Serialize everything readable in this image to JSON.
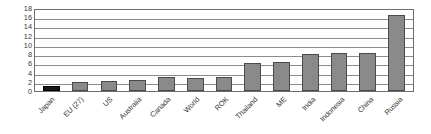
{
  "chart_data": {
    "type": "bar",
    "title": "",
    "xlabel": "",
    "ylabel": "Energy Consumption/GDP",
    "ylim": [
      0,
      18
    ],
    "ytick_step": 2,
    "yticks": [
      18,
      16,
      14,
      12,
      10,
      8,
      6,
      4,
      2,
      0
    ],
    "grid": true,
    "legend": "none",
    "categories": [
      "Japan",
      "EU (27)",
      "US",
      "Australia",
      "Canada",
      "World",
      "ROK",
      "Thailand",
      "ME",
      "India",
      "Indonesia",
      "China",
      "Russia"
    ],
    "values": [
      1.0,
      2.0,
      2.1,
      2.4,
      3.0,
      2.9,
      3.1,
      6.0,
      6.3,
      8.0,
      8.2,
      8.2,
      16.5
    ],
    "highlight_index": 0,
    "colors": {
      "bar_fill": "#8a8a8a",
      "bar_stroke": "#4a4a4a",
      "highlight_fill": "#161616",
      "highlight_stroke": "#000000",
      "gridline": "#8c8c8c",
      "axis": "#6e6e6e",
      "text": "#3a3a3a",
      "background": "#ffffff"
    }
  }
}
